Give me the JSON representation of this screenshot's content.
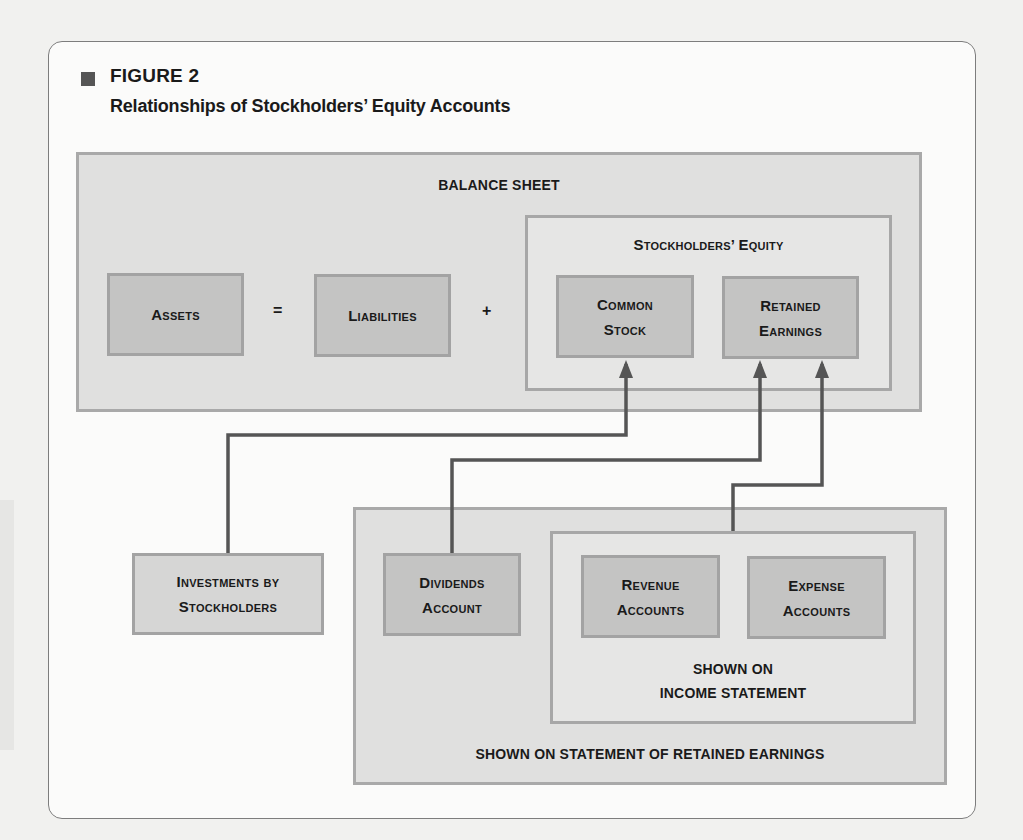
{
  "figure": {
    "label": "FIGURE 2",
    "title": "Relationships of Stockholders’ Equity Accounts"
  },
  "balance_sheet": {
    "title": "BALANCE SHEET",
    "assets": "Assets",
    "equals": "=",
    "liabilities": "Liabilities",
    "plus": "+",
    "equity": {
      "title": "Stockholders’ Equity",
      "common_stock": [
        "Common",
        "Stock"
      ],
      "retained_earnings": [
        "Retained",
        "Earnings"
      ]
    }
  },
  "investments": [
    "Investments by",
    "Stockholders"
  ],
  "retained_earnings_statement": {
    "title": "SHOWN ON STATEMENT OF RETAINED EARNINGS",
    "dividends": [
      "Dividends",
      "Account"
    ],
    "income_statement": {
      "title": [
        "SHOWN ON",
        "INCOME STATEMENT"
      ],
      "revenue": [
        "Revenue",
        "Accounts"
      ],
      "expense": [
        "Expense",
        "Accounts"
      ]
    }
  },
  "connections": [
    {
      "from": "Investments by Stockholders",
      "to": "Common Stock"
    },
    {
      "from": "Dividends Account",
      "to": "Retained Earnings"
    },
    {
      "from": "Income Statement (Revenue & Expense Accounts)",
      "to": "Retained Earnings"
    }
  ],
  "colors": {
    "frame_fill": "#e0e0df",
    "box_fill": "#c4c4c3",
    "box_border": "#a3a3a3",
    "connector": "#555555"
  }
}
